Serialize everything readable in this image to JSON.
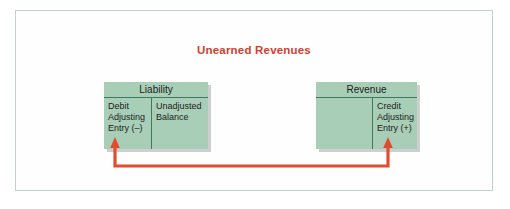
{
  "figure": {
    "title": "Unearned Revenues",
    "title_color": "#d2402f",
    "frame_border_color": "#bcd3d0",
    "box_fill_color": "#a9ceb7",
    "box_rule_color": "#3f7a5e",
    "connector_color": "#e14b30",
    "background_color": "#ffffff"
  },
  "accounts": [
    {
      "name": "liability",
      "title": "Liability",
      "debit_side": "Debit\nAdjusting\nEntry (–)",
      "credit_side": "Unadjusted\nBalance"
    },
    {
      "name": "revenue",
      "title": "Revenue",
      "debit_side": "",
      "credit_side": "Credit\nAdjusting\nEntry (+)"
    }
  ],
  "connector": {
    "description": "red line from liability debit column to revenue credit column",
    "left_arrow": "arrow-up",
    "right_arrow": "arrow-up"
  }
}
